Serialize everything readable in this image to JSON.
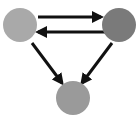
{
  "diagram": {
    "type": "directed-graph",
    "nodes": [
      {
        "id": "A",
        "cx": 20,
        "cy": 25,
        "r": 17,
        "color": "#a9a9a9"
      },
      {
        "id": "B",
        "cx": 119,
        "cy": 25,
        "r": 17,
        "color": "#7a7a7a"
      },
      {
        "id": "C",
        "cx": 73,
        "cy": 98,
        "r": 17,
        "color": "#9a9a9a"
      }
    ],
    "edges": [
      {
        "from": "A",
        "to": "B",
        "x1": 38,
        "y1": 17,
        "x2": 101,
        "y2": 17
      },
      {
        "from": "B",
        "to": "A",
        "x1": 105,
        "y1": 32,
        "x2": 38,
        "y2": 32
      },
      {
        "from": "A",
        "to": "C",
        "x1": 32,
        "y1": 43,
        "x2": 62,
        "y2": 83
      },
      {
        "from": "B",
        "to": "C",
        "x1": 112,
        "y1": 43,
        "x2": 82,
        "y2": 83
      }
    ],
    "edge_color": "#111111"
  }
}
